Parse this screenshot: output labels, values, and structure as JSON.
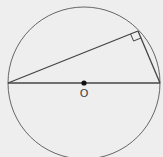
{
  "diagram": {
    "type": "geometry",
    "colors": {
      "background": "#eeeeee",
      "stroke": "#555555",
      "point": "#111111"
    },
    "circle": {
      "cx": 84,
      "cy": 83,
      "r": 76
    },
    "center_label": "O",
    "points": {
      "left_end": {
        "x": 8,
        "y": 83
      },
      "right_end": {
        "x": 160,
        "y": 83
      },
      "right_angle_vertex": {
        "x": 138,
        "y": 31
      }
    },
    "right_angle_marker": true
  }
}
